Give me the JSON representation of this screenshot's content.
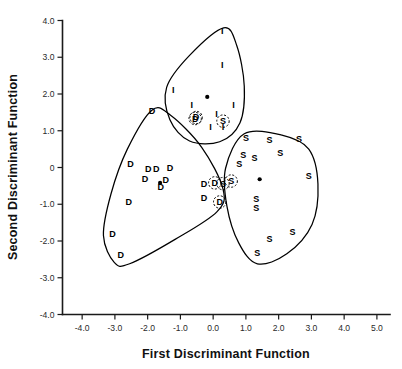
{
  "chart_data": {
    "type": "scatter",
    "title": "",
    "xlabel": "First Discriminant Function",
    "ylabel": "Second Discriminant Function",
    "xlim": [
      -4.6,
      5.4
    ],
    "ylim": [
      -4.0,
      4.0
    ],
    "xticks": [
      "-4.0",
      "-3.0",
      "-2.0",
      "-1.0",
      "0.0",
      "1.0",
      "2.0",
      "3.0",
      "4.0",
      "5.0"
    ],
    "xtick_values": [
      -4.0,
      -3.0,
      -2.0,
      -1.0,
      0.0,
      1.0,
      2.0,
      3.0,
      4.0,
      5.0
    ],
    "yticks": [
      "4.0",
      "3.0",
      "2.0",
      "1.0",
      "0",
      "-1.0",
      "-2.0",
      "-3.0",
      "-4.0"
    ],
    "ytick_values": [
      4.0,
      3.0,
      2.0,
      1.0,
      0.0,
      -1.0,
      -2.0,
      -3.0,
      -4.0
    ],
    "grid": false,
    "legend": "none",
    "marker_style": "group-letter-glyph",
    "groups": [
      {
        "name": "D",
        "label": "D",
        "centroid": {
          "x": -1.62,
          "y": -0.42
        },
        "points": [
          {
            "x": -1.87,
            "y": 1.45,
            "label": "D",
            "circled": false
          },
          {
            "x": -2.52,
            "y": 0.02,
            "label": "D",
            "circled": false
          },
          {
            "x": -1.98,
            "y": -0.12,
            "label": "D",
            "circled": false
          },
          {
            "x": -1.74,
            "y": -0.12,
            "label": "D",
            "circled": false
          },
          {
            "x": -1.32,
            "y": -0.09,
            "label": "D",
            "circled": false
          },
          {
            "x": -2.08,
            "y": -0.4,
            "label": "D",
            "circled": false
          },
          {
            "x": -1.45,
            "y": -0.42,
            "label": "D",
            "circled": false
          },
          {
            "x": -1.6,
            "y": -0.62,
            "label": "D",
            "circled": false
          },
          {
            "x": -2.58,
            "y": -1.02,
            "label": "D",
            "circled": false
          },
          {
            "x": -3.07,
            "y": -1.88,
            "label": "D",
            "circled": false
          },
          {
            "x": -2.82,
            "y": -2.45,
            "label": "D",
            "circled": false
          },
          {
            "x": -0.28,
            "y": -0.52,
            "label": "D",
            "circled": false
          },
          {
            "x": -0.28,
            "y": -0.92,
            "label": "D",
            "circled": false
          },
          {
            "x": -0.52,
            "y": 1.28,
            "label": "D",
            "circled": true
          },
          {
            "x": 0.05,
            "y": -0.5,
            "label": "D",
            "circled": true
          },
          {
            "x": 0.2,
            "y": -1.02,
            "label": "D",
            "circled": true
          }
        ]
      },
      {
        "name": "I",
        "label": "I",
        "centroid": {
          "x": -0.18,
          "y": 1.92
        },
        "points": [
          {
            "x": 0.28,
            "y": 3.62,
            "label": "I",
            "circled": false
          },
          {
            "x": 0.28,
            "y": 2.7,
            "label": "I",
            "circled": false
          },
          {
            "x": -1.22,
            "y": 2.02,
            "label": "I",
            "circled": false
          },
          {
            "x": -0.65,
            "y": 1.62,
            "label": "I",
            "circled": false
          },
          {
            "x": 0.62,
            "y": 1.62,
            "label": "I",
            "circled": false
          },
          {
            "x": 0.1,
            "y": 1.38,
            "label": "I",
            "circled": false
          },
          {
            "x": -0.08,
            "y": 1.02,
            "label": "I",
            "circled": false
          },
          {
            "x": 0.3,
            "y": 1.02,
            "label": "I",
            "circled": false
          },
          {
            "x": -0.55,
            "y": 1.25,
            "label": "D",
            "circled": true
          },
          {
            "x": 0.3,
            "y": 1.18,
            "label": "S",
            "circled": true
          }
        ]
      },
      {
        "name": "S",
        "label": "S",
        "centroid": {
          "x": 1.42,
          "y": -0.32
        },
        "points": [
          {
            "x": 1.0,
            "y": 0.72,
            "label": "S",
            "circled": false
          },
          {
            "x": 1.72,
            "y": 0.66,
            "label": "S",
            "circled": false
          },
          {
            "x": 2.62,
            "y": 0.7,
            "label": "S",
            "circled": false
          },
          {
            "x": 0.92,
            "y": 0.26,
            "label": "S",
            "circled": false
          },
          {
            "x": 1.26,
            "y": 0.18,
            "label": "S",
            "circled": false
          },
          {
            "x": 2.05,
            "y": 0.3,
            "label": "S",
            "circled": false
          },
          {
            "x": 0.8,
            "y": 0.02,
            "label": "S",
            "circled": false
          },
          {
            "x": 2.92,
            "y": -0.3,
            "label": "S",
            "circled": false
          },
          {
            "x": 1.32,
            "y": -0.95,
            "label": "S",
            "circled": false
          },
          {
            "x": 1.32,
            "y": -1.18,
            "label": "S",
            "circled": false
          },
          {
            "x": 2.42,
            "y": -1.85,
            "label": "S",
            "circled": false
          },
          {
            "x": 1.72,
            "y": -2.02,
            "label": "S",
            "circled": false
          },
          {
            "x": 1.35,
            "y": -2.42,
            "label": "S",
            "circled": false
          },
          {
            "x": 0.55,
            "y": -0.45,
            "label": "S",
            "circled": true
          },
          {
            "x": 0.3,
            "y": -0.52,
            "label": "S",
            "circled": true
          }
        ]
      }
    ],
    "hulls": [
      {
        "name": "hull-D",
        "comment": "convex boundary around the D group",
        "vertices": [
          {
            "x": -1.87,
            "y": 1.56
          },
          {
            "x": -2.62,
            "y": 0.5
          },
          {
            "x": -3.12,
            "y": -0.72
          },
          {
            "x": -3.35,
            "y": -1.85
          },
          {
            "x": -3.02,
            "y": -2.58
          },
          {
            "x": -2.55,
            "y": -2.62
          },
          {
            "x": -1.15,
            "y": -1.95
          },
          {
            "x": 0.12,
            "y": -1.2
          },
          {
            "x": 0.3,
            "y": -0.58
          },
          {
            "x": -0.35,
            "y": 0.55
          },
          {
            "x": -1.3,
            "y": 1.42
          }
        ]
      },
      {
        "name": "hull-I",
        "comment": "convex boundary around the I group",
        "vertices": [
          {
            "x": 0.32,
            "y": 3.8
          },
          {
            "x": -0.72,
            "y": 3.05
          },
          {
            "x": -1.42,
            "y": 2.18
          },
          {
            "x": -1.32,
            "y": 1.3
          },
          {
            "x": -0.72,
            "y": 0.72
          },
          {
            "x": 0.2,
            "y": 0.7
          },
          {
            "x": 0.82,
            "y": 1.22
          },
          {
            "x": 0.95,
            "y": 2.22
          },
          {
            "x": 0.72,
            "y": 3.32
          }
        ]
      },
      {
        "name": "hull-S",
        "comment": "convex boundary around the S group",
        "vertices": [
          {
            "x": 0.95,
            "y": 0.92
          },
          {
            "x": 2.1,
            "y": 0.88
          },
          {
            "x": 2.92,
            "y": 0.5
          },
          {
            "x": 3.2,
            "y": -0.45
          },
          {
            "x": 3.02,
            "y": -1.55
          },
          {
            "x": 2.25,
            "y": -2.35
          },
          {
            "x": 1.35,
            "y": -2.62
          },
          {
            "x": 0.78,
            "y": -2.05
          },
          {
            "x": 0.42,
            "y": -1.05
          },
          {
            "x": 0.38,
            "y": -0.02
          }
        ]
      }
    ]
  },
  "axes": {
    "x_label": "First Discriminant Function",
    "y_label": "Second Discriminant Function"
  }
}
